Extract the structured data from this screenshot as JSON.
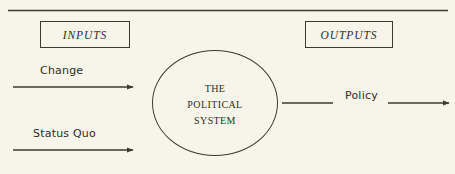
{
  "diagram": {
    "title_rule": "top-horizontal-rule",
    "background_color": "#f7f5e9",
    "ink_color": "#2e2d26",
    "boxes": [
      {
        "id": "inputs",
        "label": "INPUTS"
      },
      {
        "id": "outputs",
        "label": "OUTPUTS"
      }
    ],
    "center_node": {
      "shape": "circle",
      "lines": [
        "The",
        "Political",
        "System"
      ],
      "full_label": "The Political System"
    },
    "flows": [
      {
        "id": "change",
        "label": "Change",
        "direction": "into-system",
        "arrowhead": true
      },
      {
        "id": "status-quo",
        "label": "Status Quo",
        "direction": "into-system",
        "arrowhead": true
      },
      {
        "id": "policy",
        "label": "Policy",
        "direction": "out-of-system",
        "arrowhead": true
      }
    ]
  }
}
